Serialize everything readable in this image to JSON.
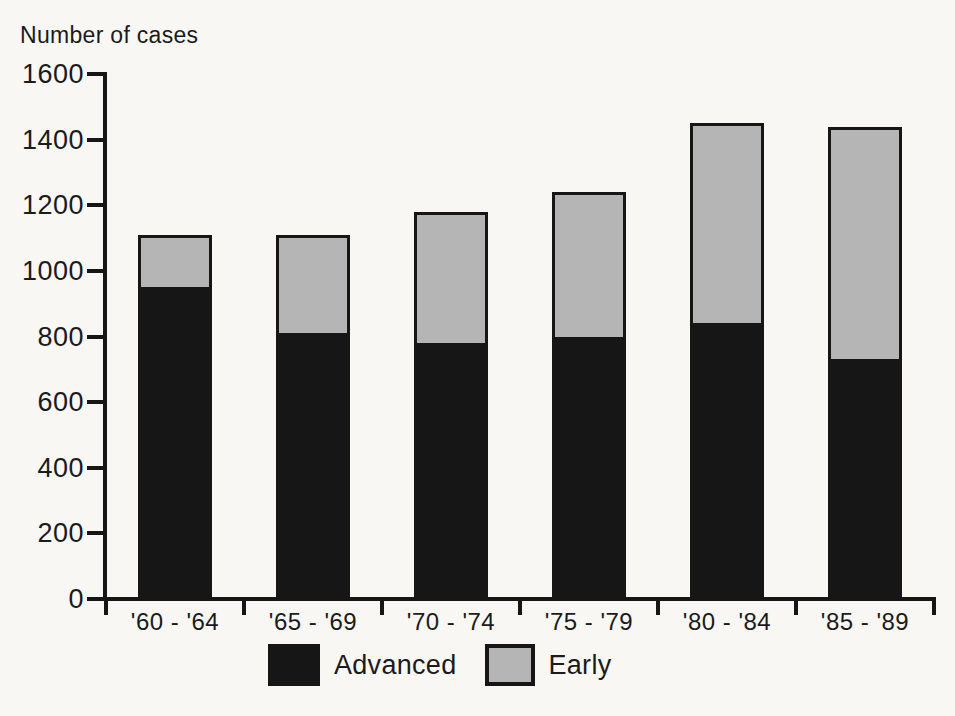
{
  "page": {
    "background": "#f8f7f4",
    "ink": "#161616"
  },
  "chart_data": {
    "type": "bar",
    "stacked": true,
    "title": "",
    "ylabel": "Number of cases",
    "xlabel": "",
    "categories": [
      "'60 - '64",
      "'65 - '69",
      "'70 - '74",
      "'75 - '79",
      "'80 - '84",
      "'85 - '89"
    ],
    "series": [
      {
        "name": "Advanced",
        "color": "#161616",
        "pattern": "solid",
        "values": [
          950,
          810,
          780,
          800,
          840,
          730
        ]
      },
      {
        "name": "Early",
        "color": "#b5b5b5",
        "pattern": "dither",
        "values": [
          160,
          300,
          400,
          440,
          610,
          710
        ]
      }
    ],
    "stack_totals": [
      1110,
      1110,
      1180,
      1240,
      1450,
      1440
    ],
    "ylim": [
      0,
      1600
    ],
    "yticks": [
      0,
      200,
      400,
      600,
      800,
      1000,
      1200,
      1400,
      1600
    ],
    "grid": false,
    "legend_position": "bottom"
  }
}
